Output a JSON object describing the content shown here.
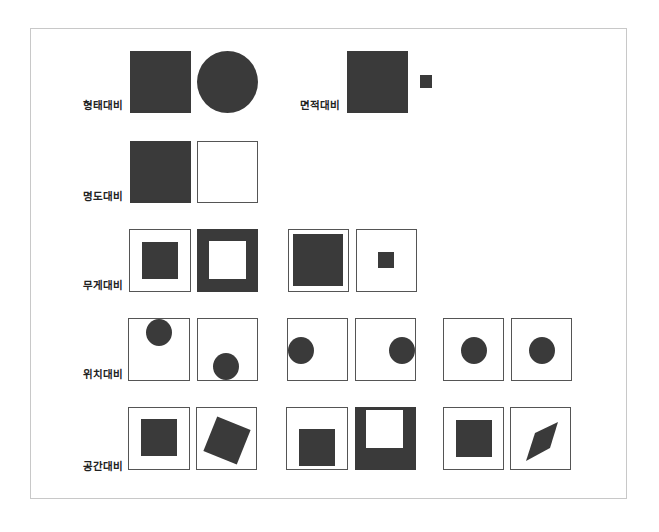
{
  "figure": {
    "title": "",
    "colors": {
      "shape": "#3a3a3a",
      "box_border": "#555555",
      "frame_border": "#c8c8c8",
      "background": "#ffffff"
    },
    "labels": {
      "shape_contrast": "형태대비",
      "area_contrast": "면적대비",
      "value_contrast": "명도대비",
      "weight_contrast": "무게대비",
      "position_contrast": "위치대비",
      "space_contrast": "공간대비"
    },
    "rows": [
      {
        "label": "형태대비",
        "items": [
          "filled square",
          "filled circle"
        ]
      },
      {
        "label": "면적대비",
        "items": [
          "large filled square",
          "small filled square"
        ]
      },
      {
        "label": "명도대비",
        "items": [
          "filled square",
          "empty square"
        ]
      },
      {
        "label": "무게대비",
        "items": [
          "box with small dark square",
          "dark box with white center",
          "box nearly filled dark",
          "box with tiny dark square"
        ]
      },
      {
        "label": "위치대비",
        "items": [
          "circle top",
          "circle bottom",
          "circle left",
          "circle right",
          "circle center",
          "circle center"
        ]
      },
      {
        "label": "공간대비",
        "items": [
          "centered square",
          "rotated square",
          "square lower",
          "dark box with white upper square",
          "centered square",
          "rhombus"
        ]
      }
    ]
  }
}
